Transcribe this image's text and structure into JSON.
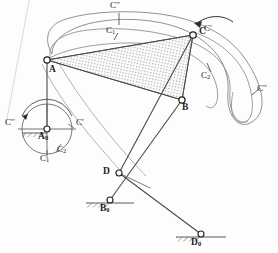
{
  "figure": {
    "type": "kinematic-linkage-diagram",
    "width": 278,
    "height": 253,
    "background_color": "#fdfdfd",
    "line_color": "#4a4a4a",
    "hatch_color": "#6f6f6f",
    "label_color": "#1c1c1c"
  },
  "joints": {
    "A": {
      "label": "A",
      "x": 47,
      "y": 60,
      "type": "moving-pivot"
    },
    "A0": {
      "label": "A",
      "subscript": "0",
      "x": 47,
      "y": 129,
      "type": "fixed-pivot"
    },
    "B": {
      "label": "B",
      "x": 182,
      "y": 100,
      "type": "moving-pivot"
    },
    "B0": {
      "label": "B",
      "subscript": "0",
      "x": 110,
      "y": 200,
      "type": "fixed-pivot"
    },
    "C": {
      "label": "C",
      "x": 193,
      "y": 35,
      "type": "coupler-point"
    },
    "D": {
      "label": "D",
      "x": 119,
      "y": 173,
      "type": "moving-pivot"
    },
    "D0": {
      "label": "D",
      "subscript": "0",
      "x": 201,
      "y": 234,
      "type": "fixed-pivot"
    }
  },
  "curve_labels": [
    {
      "name": "C-double-prime-top",
      "text": "C′′",
      "x": 113,
      "y": 4
    },
    {
      "name": "C1-top",
      "text": "C",
      "subscript": "1",
      "x": 108,
      "y": 31
    },
    {
      "name": "C-prime-coupler",
      "text": "C′",
      "x": 205,
      "y": 29
    },
    {
      "name": "C2-right",
      "text": "C",
      "subscript": "2",
      "x": 203,
      "y": 76
    },
    {
      "name": "C-double-prime-right",
      "text": "C′′",
      "x": 258,
      "y": 89
    },
    {
      "name": "C-double-prime-circle-left",
      "text": "C′′",
      "x": 8,
      "y": 122
    },
    {
      "name": "C-prime-circle-right",
      "text": "C′",
      "x": 76,
      "y": 122
    },
    {
      "name": "C1-circle",
      "text": "C",
      "subscript": "1",
      "x": 42,
      "y": 154
    },
    {
      "name": "C2-circle",
      "text": "C",
      "subscript": "2",
      "x": 58,
      "y": 147
    }
  ],
  "point_labels": [
    {
      "name": "label-A",
      "text": "A",
      "x": 50,
      "y": 67
    },
    {
      "name": "label-A0",
      "text": "A",
      "subscript": "0",
      "x": 39,
      "y": 134
    },
    {
      "name": "label-B",
      "text": "B",
      "x": 184,
      "y": 104
    },
    {
      "name": "label-B0",
      "text": "B",
      "subscript": "0",
      "x": 101,
      "y": 206
    },
    {
      "name": "label-C",
      "text": "C",
      "x": 200,
      "y": 29
    },
    {
      "name": "label-D",
      "text": "D",
      "x": 105,
      "y": 169
    },
    {
      "name": "label-D0",
      "text": "D",
      "subscript": "0",
      "x": 192,
      "y": 240
    }
  ]
}
